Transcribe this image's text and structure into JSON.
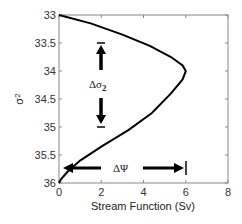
{
  "chart_data": {
    "type": "line",
    "title": "",
    "xlabel": "Stream Function (Sv)",
    "ylabel": "σ2",
    "xlim": [
      0,
      8
    ],
    "ylim": [
      36,
      33
    ],
    "y_reversed": true,
    "xticks": [
      "0",
      "2",
      "4",
      "6",
      "8"
    ],
    "yticks": [
      "33",
      "33.5",
      "34",
      "34.5",
      "35",
      "35.5",
      "36"
    ],
    "grid": false,
    "series": [
      {
        "name": "stream function profile",
        "x": [
          0,
          1.5,
          3.0,
          4.3,
          5.3,
          5.85,
          6.0,
          5.85,
          5.3,
          4.4,
          3.3,
          2.0,
          1.0,
          0.4,
          0.1,
          0
        ],
        "y": [
          33,
          33.15,
          33.35,
          33.55,
          33.75,
          33.9,
          34.0,
          34.15,
          34.4,
          34.75,
          35.05,
          35.35,
          35.6,
          35.8,
          35.93,
          36
        ]
      }
    ],
    "annotations": [
      {
        "text": "Δσ2",
        "x": 2,
        "y": 34.25,
        "type": "double-arrow-vertical",
        "from": 33.5,
        "to": 35.0
      },
      {
        "text": "ΔΨ",
        "x": 3,
        "y": 35.75,
        "type": "double-arrow-horizontal",
        "from": 0.2,
        "to": 6.0
      }
    ]
  },
  "labels": {
    "xlabel": "Stream Function (Sv)",
    "ylabel_main": "σ",
    "ylabel_sub": "2",
    "delta_sigma_main": "Δσ",
    "delta_sigma_sub": "2",
    "delta_psi": "ΔΨ"
  }
}
